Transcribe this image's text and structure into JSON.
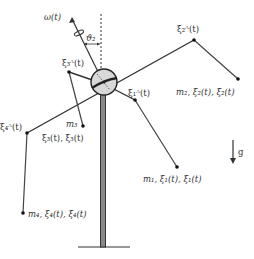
{
  "diagram": {
    "labels": {
      "omega": "ω(t)",
      "theta": "ϑ₂",
      "xi3A": "ξ₃ᴬ(t)",
      "xi2A": "ξ₂ᴬ(t)",
      "xi1A": "ξ₁ᴬ(t)",
      "xi4A": "ξ₄ᴬ(t)",
      "m2": "m₂, ξ₂(t), ξ̇₂(t)",
      "m3": "m₃",
      "m3_state": "ξ₃(t), ξ̇₃(t)",
      "m1": "m₁, ξ₁(t), ξ̇₁(t)",
      "m4": "m₄, ξ₄(t), ξ̇₄(t)",
      "gravity": "g"
    },
    "colors": {
      "line": "#333333",
      "hub_fill": "#d8d8d8",
      "pole_fill": "#888888"
    }
  }
}
